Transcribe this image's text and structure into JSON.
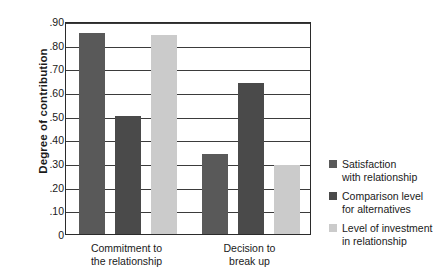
{
  "chart_data": {
    "type": "bar",
    "title": "",
    "xlabel": "",
    "ylabel": "Degree of contribution",
    "categories": [
      "Commitment to\nthe relationship",
      "Decision to\nbreak up"
    ],
    "series": [
      {
        "name": "Satisfaction\nwith relationship",
        "color": "#595959",
        "values": [
          0.85,
          0.34
        ]
      },
      {
        "name": "Comparison level\nfor alternatives",
        "color": "#4a4a4a",
        "values": [
          0.5,
          0.64
        ]
      },
      {
        "name": "Level of investment\nin relationship",
        "color": "#cbcbcb",
        "values": [
          0.84,
          0.29
        ]
      }
    ],
    "ylim": [
      0,
      0.9
    ],
    "ytick_values": [
      0.9,
      0.8,
      0.7,
      0.6,
      0.5,
      0.4,
      0.3,
      0.2,
      0.1,
      0
    ],
    "ytick_labels": [
      ".90",
      ".80",
      ".70",
      ".60",
      ".50",
      ".40",
      ".30",
      ".20",
      ".10",
      "0"
    ],
    "grid": true,
    "legend_position": "right"
  }
}
